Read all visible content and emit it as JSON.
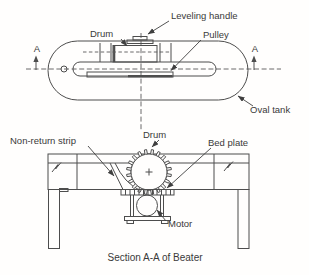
{
  "drawing": {
    "title": "Section A-A of Beater",
    "top_view": {
      "labels": {
        "leveling_handle": "Leveling handle",
        "drum": "Drum",
        "pulley": "Pulley",
        "oval_tank": "Oval tank",
        "section_marker_left": "A",
        "section_marker_right": "A"
      }
    },
    "section_view": {
      "labels": {
        "non_return_strip": "Non-return strip",
        "drum": "Drum",
        "bed_plate": "Bed plate",
        "motor": "Motor"
      },
      "caption": "Section A-A of Beater"
    },
    "colors": {
      "background": "#fffefd",
      "line": "#4d4d4d",
      "text": "#3a3a3a"
    }
  }
}
